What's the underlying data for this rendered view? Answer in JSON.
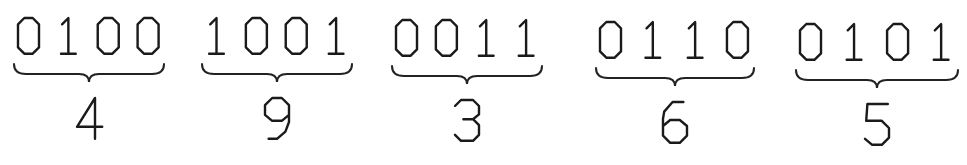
{
  "diagram": {
    "groups": [
      {
        "bits": "0100",
        "value": "4",
        "x": 14,
        "width": 150,
        "y": 18
      },
      {
        "bits": "1001",
        "value": "9",
        "x": 202,
        "width": 150,
        "y": 18
      },
      {
        "bits": "0011",
        "value": "3",
        "x": 392,
        "width": 150,
        "y": 20
      },
      {
        "bits": "0110",
        "value": "6",
        "x": 596,
        "width": 158,
        "y": 22
      },
      {
        "bits": "0101",
        "value": "5",
        "x": 796,
        "width": 162,
        "y": 24
      }
    ],
    "stroke_color": "#1a1a1a",
    "background": "#ffffff"
  }
}
